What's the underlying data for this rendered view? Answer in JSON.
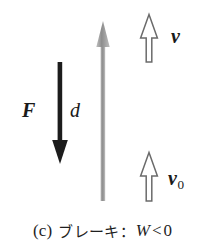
{
  "figure": {
    "type": "physics-vector-diagram",
    "background_color": "#ffffff",
    "width": 205,
    "height": 247
  },
  "labels": {
    "force": "F",
    "displacement": "d",
    "velocity_final": "v",
    "velocity_initial_base": "v",
    "velocity_initial_subscript": "0"
  },
  "caption": {
    "index": "(c)",
    "text": "ブレーキ：",
    "formula_symbol": "W",
    "formula_relation": "<",
    "formula_value": "0",
    "full": "(c) ブレーキ：W < 0"
  },
  "arrows": {
    "force_arrow": {
      "name": "F",
      "direction": "down",
      "style": "solid-filled",
      "color": "#1a1a1a",
      "x": 60,
      "y_start": 62,
      "y_end": 163
    },
    "displacement_arrow": {
      "name": "d",
      "direction": "up",
      "style": "solid-shaded",
      "color": "#8c8c8c",
      "x": 103,
      "y_start": 201,
      "y_end": 22
    },
    "velocity_final_arrow": {
      "name": "v",
      "direction": "up",
      "style": "hollow-outline",
      "color": "#666666",
      "fill": "#ffffff",
      "x": 149,
      "y_start": 62,
      "y_end": 14
    },
    "velocity_initial_arrow": {
      "name": "v0",
      "direction": "up",
      "style": "hollow-outline",
      "color": "#666666",
      "fill": "#ffffff",
      "x": 149,
      "y_start": 201,
      "y_end": 152
    }
  },
  "colors": {
    "ink": "#1a1a1a",
    "gray_arrow": "#8c8c8c",
    "outline": "#666666",
    "background": "#ffffff"
  }
}
